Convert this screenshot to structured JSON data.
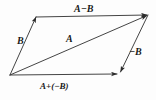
{
  "figure": {
    "type": "vector-parallelogram-diagram",
    "width": 156,
    "height": 100,
    "background_color": "#fdfdfd",
    "stroke_color": "#3a3a3a",
    "text_color": "#1a1a1a"
  },
  "labels": {
    "top": "A−B",
    "left": "B",
    "diagonal": "A",
    "right": "−B",
    "bottom": "A+(−B)"
  },
  "vertices": {
    "bottom_left": {
      "x": 10,
      "y": 75
    },
    "top_left": {
      "x": 36,
      "y": 17
    },
    "top_right": {
      "x": 148,
      "y": 15
    },
    "bottom_right": {
      "x": 120,
      "y": 73
    }
  },
  "vectors": [
    {
      "name": "vector-b-left",
      "label": "B",
      "from": {
        "x": 10,
        "y": 75
      },
      "to": {
        "x": 36,
        "y": 17
      },
      "arrow_at": "end"
    },
    {
      "name": "vector-a-minus-b-top",
      "label": "A−B",
      "from": {
        "x": 36,
        "y": 17
      },
      "to": {
        "x": 148,
        "y": 15
      },
      "arrow_at": "end"
    },
    {
      "name": "vector-a-diagonal",
      "label": "A",
      "from": {
        "x": 10,
        "y": 75
      },
      "to": {
        "x": 148,
        "y": 15
      },
      "arrow_at": "end"
    },
    {
      "name": "vector-minus-b-right",
      "label": "−B",
      "from": {
        "x": 148,
        "y": 15
      },
      "to": {
        "x": 120,
        "y": 73
      },
      "arrow_at": "end"
    },
    {
      "name": "vector-a-plus-minus-b-bottom",
      "label": "A+(−B)",
      "from": {
        "x": 10,
        "y": 75
      },
      "to": {
        "x": 118,
        "y": 74
      },
      "arrow_at": "end"
    }
  ]
}
